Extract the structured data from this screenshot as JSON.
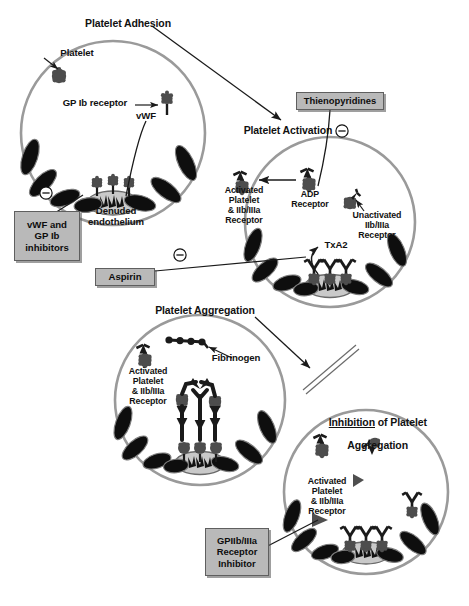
{
  "figure": {
    "bg_color": "#ffffff",
    "ink_color": "#111111",
    "vessel_wall_color": "#8f8f8f",
    "endothelial_cell_color": "#101010",
    "platelet_color": "#4d4d4d",
    "subendothelium_color": "#c9c9c9",
    "box_fill": "#b9b9b9",
    "box_border": "#5f5f5f"
  },
  "panels": [
    {
      "id": "adhesion",
      "heading": "Platelet Adhesion",
      "labels": [
        {
          "name": "platelet",
          "text": "Platelet"
        },
        {
          "name": "gp-ib-receptor",
          "text": "GP Ib receptor"
        },
        {
          "name": "vwf",
          "text": "vWF"
        },
        {
          "name": "denuded-endothelium",
          "text": "Denuded\nendothelium"
        }
      ]
    },
    {
      "id": "activation",
      "heading": "Platelet Activation",
      "labels": [
        {
          "name": "activated-platelet",
          "text": "Activated\nPlatelet\n& IIb/IIIa\nReceptor"
        },
        {
          "name": "adp-receptor",
          "text": "ADP\nReceptor"
        },
        {
          "name": "unactivated-receptor",
          "text": "Unactivated\nIIb/IIIa\nReceptor"
        },
        {
          "name": "txa2",
          "text": "TxA2"
        }
      ]
    },
    {
      "id": "aggregation",
      "heading": "Platelet Aggregation",
      "labels": [
        {
          "name": "activated-platelet",
          "text": "Activated\nPlatelet\n& IIb/IIIa\nReceptor"
        },
        {
          "name": "fibrinogen",
          "text": "Fibrinogen"
        }
      ]
    },
    {
      "id": "inhibition",
      "heading_part1": "Inhibition",
      "heading_part2": " of Platelet",
      "heading_line2": "Aggregation",
      "labels": [
        {
          "name": "activated-platelet",
          "text": "Activated\nPlatelet\n& IIb/IIIa\nReceptor"
        }
      ]
    }
  ],
  "headings": {
    "adhesion": "Platelet Adhesion",
    "activation": "Platelet Activation",
    "aggregation": "Platelet Aggregation",
    "inhibition_underlined": "Inhibition",
    "inhibition_rest": " of Platelet",
    "inhibition_line2": "Aggregation"
  },
  "drug_boxes": [
    {
      "name": "vwf-gpib-inhibitors",
      "text": "vWF and\nGP Ib\ninhibitors"
    },
    {
      "name": "aspirin",
      "text": "Aspirin"
    },
    {
      "name": "thienopyridines",
      "text": "Thienopyridines"
    },
    {
      "name": "gpiibiiia-receptor-inhibitor",
      "text": "GPIIb/IIIa\nReceptor\nInhibitor"
    }
  ],
  "inhibition_symbols": [
    {
      "name": "inhibition-symbol-vwf",
      "glyph": "⊖"
    },
    {
      "name": "inhibition-symbol-aspirin",
      "glyph": "⊖"
    },
    {
      "name": "inhibition-symbol-thienopyridines",
      "glyph": "⊖"
    }
  ],
  "panel_labels": {
    "platelet": "Platelet",
    "gp_ib_receptor": "GP Ib receptor",
    "vwf": "vWF",
    "denuded_endothelium": "Denuded\nendothelium",
    "activated_platelet": "Activated\nPlatelet\n& IIb/IIIa\nReceptor",
    "adp_receptor": "ADP\nReceptor",
    "unactivated_receptor": "Unactivated\nIIb/IIIa\nReceptor",
    "txa2": "TxA2",
    "fibrinogen": "Fibrinogen"
  }
}
